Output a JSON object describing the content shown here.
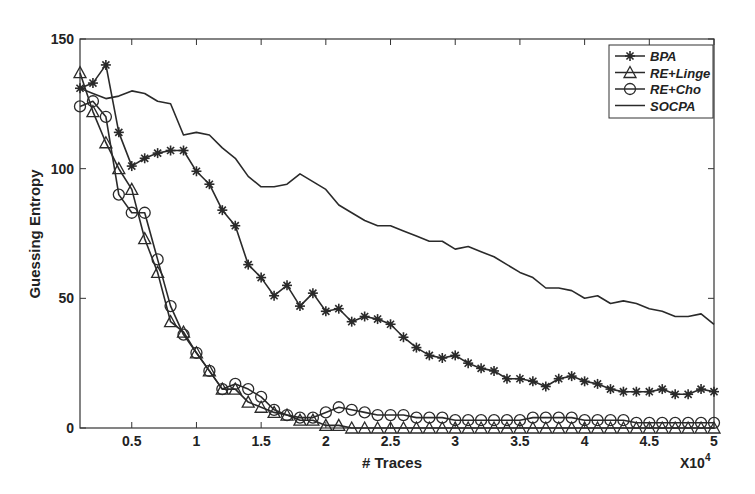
{
  "chart_data": {
    "type": "line",
    "title": "",
    "xlabel": "# Traces",
    "ylabel": "Guessing Entropy",
    "x_multiplier_label": "X10",
    "x_multiplier_exp": "4",
    "xlim": [
      0.1,
      5
    ],
    "ylim": [
      0,
      150
    ],
    "xticks": [
      0.5,
      1,
      1.5,
      2,
      2.5,
      3,
      3.5,
      4,
      4.5,
      5
    ],
    "xtick_labels": [
      "0.5",
      "1",
      "1.5",
      "2",
      "2.5",
      "3",
      "3.5",
      "4",
      "4.5",
      "5"
    ],
    "yticks": [
      0,
      50,
      100,
      150
    ],
    "ytick_labels": [
      "0",
      "50",
      "100",
      "150"
    ],
    "grid": false,
    "legend_position": "upper right",
    "x": [
      0.1,
      0.2,
      0.3,
      0.4,
      0.5,
      0.6,
      0.7,
      0.8,
      0.9,
      1.0,
      1.1,
      1.2,
      1.3,
      1.4,
      1.5,
      1.6,
      1.7,
      1.8,
      1.9,
      2.0,
      2.1,
      2.2,
      2.3,
      2.4,
      2.5,
      2.6,
      2.7,
      2.8,
      2.9,
      3.0,
      3.1,
      3.2,
      3.3,
      3.4,
      3.5,
      3.6,
      3.7,
      3.8,
      3.9,
      4.0,
      4.1,
      4.2,
      4.3,
      4.4,
      4.5,
      4.6,
      4.7,
      4.8,
      4.9,
      5.0
    ],
    "series": [
      {
        "name": "BPA",
        "marker": "star",
        "values": [
          131,
          133,
          140,
          114,
          101,
          104,
          106,
          107,
          107,
          99,
          94,
          84,
          78,
          63,
          58,
          51,
          55,
          47,
          52,
          45,
          46,
          41,
          43,
          42,
          40,
          35,
          31,
          28,
          27,
          28,
          25,
          23,
          22,
          19,
          19,
          18,
          16,
          19,
          20,
          18,
          17,
          15,
          14,
          14,
          14,
          15,
          13,
          13,
          15,
          14
        ]
      },
      {
        "name": "RE+Linge",
        "marker": "triangle",
        "values": [
          137,
          122,
          110,
          100,
          92,
          73,
          60,
          41,
          37,
          29,
          22,
          15,
          15,
          10,
          8,
          6,
          5,
          3,
          3,
          1,
          1,
          0,
          0,
          0,
          0,
          0,
          0,
          0,
          0,
          0,
          0,
          0,
          0,
          0,
          0,
          0,
          0,
          0,
          0,
          0,
          0,
          0,
          0,
          0,
          0,
          0,
          0,
          0,
          0,
          0
        ]
      },
      {
        "name": "RE+Cho",
        "marker": "circle",
        "values": [
          124,
          126,
          120,
          90,
          83,
          83,
          65,
          47,
          36,
          29,
          22,
          15,
          17,
          15,
          12,
          7,
          5,
          4,
          4,
          6,
          8,
          7,
          6,
          5,
          5,
          5,
          4,
          4,
          4,
          3,
          3,
          3,
          3,
          3,
          3,
          4,
          4,
          4,
          4,
          3,
          3,
          3,
          3,
          2,
          2,
          2,
          2,
          2,
          2,
          2
        ]
      },
      {
        "name": "SOCPA",
        "marker": "none",
        "values": [
          131,
          129,
          127,
          128,
          130,
          129,
          126,
          125,
          113,
          114,
          113,
          108,
          104,
          97,
          93,
          93,
          94,
          98,
          95,
          92,
          86,
          83,
          80,
          78,
          78,
          76,
          74,
          72,
          72,
          69,
          70,
          68,
          66,
          63,
          60,
          58,
          54,
          54,
          53,
          50,
          51,
          48,
          49,
          48,
          46,
          45,
          43,
          43,
          44,
          40
        ]
      }
    ]
  },
  "colors": {
    "line": "#2a2a2a",
    "axis": "#333333",
    "background": "#ffffff"
  }
}
